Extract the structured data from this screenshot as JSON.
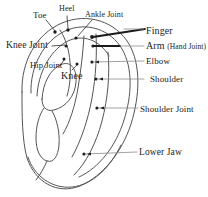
{
  "figure": {
    "background_color": "#ffffff",
    "ink_color": "#2b2b2b",
    "outline_color": "#555555"
  },
  "labels": {
    "toe": "Toe",
    "heel": "Heel",
    "ankle_joint": "Ankle Joint",
    "finger": "Finger",
    "arm_main": "Arm ",
    "arm_paren": "(Hand Joint)",
    "elbow": "Elbow",
    "shoulder": "Shoulder",
    "shoulder_joint": "Shoulder Joint",
    "lower_jaw": "Lower Jaw",
    "knee_joint": "Knee Joint",
    "hip_joint": "Hip Joint",
    "knee": "Knee"
  },
  "points": [
    {
      "name": "toe",
      "x": 55,
      "y": 32
    },
    {
      "name": "heel",
      "x": 68,
      "y": 30
    },
    {
      "name": "ankle-joint",
      "x": 76,
      "y": 38
    },
    {
      "name": "knee-joint",
      "x": 66,
      "y": 46
    },
    {
      "name": "hip-joint",
      "x": 64,
      "y": 59
    },
    {
      "name": "knee",
      "x": 77,
      "y": 64
    },
    {
      "name": "finger",
      "x": 92,
      "y": 37
    },
    {
      "name": "arm-hand-joint",
      "x": 93,
      "y": 46
    },
    {
      "name": "elbow",
      "x": 92,
      "y": 62
    },
    {
      "name": "shoulder",
      "x": 96,
      "y": 79
    },
    {
      "name": "shoulder-joint",
      "x": 97,
      "y": 108
    },
    {
      "name": "lower-jaw",
      "x": 84,
      "y": 154
    }
  ]
}
